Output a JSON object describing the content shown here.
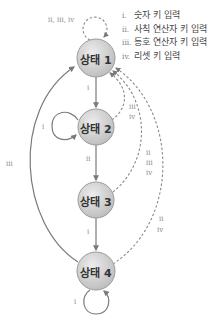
{
  "legend": {
    "items": [
      {
        "num": "i.",
        "label": "숫자 키 입력"
      },
      {
        "num": "ii.",
        "label": "사칙 연산자 키 입력"
      },
      {
        "num": "iii.",
        "label": "등호 연산자 키 입력"
      },
      {
        "num": "iv.",
        "label": "리셋 키 입력"
      }
    ]
  },
  "states": [
    {
      "label": "상태 1"
    },
    {
      "label": "상태 2"
    },
    {
      "label": "상태 3"
    },
    {
      "label": "상태 4"
    }
  ],
  "edges": {
    "s1_self": "ii, iii, iv",
    "s1_to_s2": "i",
    "s2_self": "i",
    "s2_to_s3": "ii",
    "s2_to_s1_a": "iii",
    "s2_to_s1_b": "iv",
    "s3_to_s4": "i",
    "s3_to_s1_a": "ii",
    "s3_to_s1_b": "iii",
    "s3_to_s1_c": "iv",
    "s4_to_s1_left": "iii",
    "s4_to_s1_a": "ii",
    "s4_to_s1_b": "iv",
    "s4_self": "i"
  },
  "colors": {
    "node_fill_top": "#e6e6e6",
    "node_fill_bottom": "#bdbdbd",
    "node_stroke": "#9a9a9a",
    "edge": "#7a7a7a",
    "text": "#333333"
  }
}
